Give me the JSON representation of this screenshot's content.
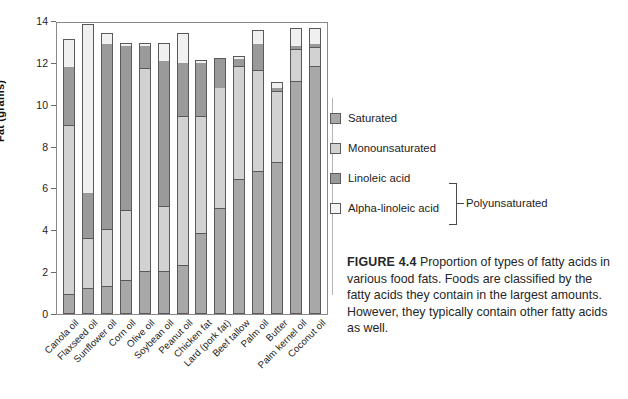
{
  "figure": {
    "number_label": "FIGURE 4.4",
    "caption_text": " Proportion of types of fatty acids in various food fats. Foods are classified by the fatty acids they contain in the largest amounts. However, they typically contain other fatty acids as well."
  },
  "legend": {
    "entries": [
      {
        "label": "Saturated",
        "key": "sat",
        "color": "#a8a8a8"
      },
      {
        "label": "Monounsaturated",
        "key": "mono",
        "color": "#d2d2d2"
      },
      {
        "label": "Linoleic acid",
        "key": "lin",
        "color": "#9a9a9a"
      },
      {
        "label": "Alpha-linoleic acid",
        "key": "ala",
        "color": "#f4f4f4"
      }
    ],
    "group_bracket_label": "Polyunsaturated"
  },
  "chart_data": {
    "type": "bar",
    "subtype": "stacked-vertical",
    "title": "",
    "xlabel": "",
    "ylabel": "Fat (grams)",
    "ylim": [
      0,
      14
    ],
    "ytick_values": [
      0,
      2,
      4,
      6,
      8,
      10,
      12,
      14
    ],
    "ytick_labels": [
      "0",
      "2",
      "4",
      "6",
      "8",
      "10",
      "12",
      "14"
    ],
    "grid": false,
    "legend_position": "right",
    "categories": [
      "Canola oil",
      "Flaxseed oil",
      "Sunflower oil",
      "Corn oil",
      "Olive oil",
      "Soybean oil",
      "Peanut oil",
      "Chicken fat",
      "Lard (pork fat)",
      "Beef tallow",
      "Palm oil",
      "Butter",
      "Palm kernel oil",
      "Coconut oil"
    ],
    "series": [
      {
        "name": "Saturated",
        "key": "sat",
        "color": "#a8a8a8",
        "values": [
          0.9,
          1.2,
          1.3,
          1.6,
          2.0,
          2.0,
          2.3,
          3.8,
          5.0,
          6.4,
          6.8,
          7.2,
          11.1,
          11.8
        ]
      },
      {
        "name": "Monounsaturated",
        "key": "mono",
        "color": "#d2d2d2",
        "values": [
          8.1,
          2.4,
          2.7,
          3.3,
          9.7,
          3.1,
          7.1,
          5.6,
          5.8,
          5.4,
          4.8,
          3.4,
          1.5,
          0.9
        ]
      },
      {
        "name": "Linoleic acid",
        "key": "lin",
        "color": "#9a9a9a",
        "values": [
          2.8,
          2.2,
          8.9,
          7.9,
          1.1,
          7.0,
          2.6,
          2.6,
          1.4,
          0.4,
          1.3,
          0.2,
          0.2,
          0.2
        ]
      },
      {
        "name": "Alpha-linoleic acid",
        "key": "ala",
        "color": "#f0f0f0",
        "values": [
          1.3,
          8.0,
          0.5,
          0.1,
          0.1,
          0.8,
          1.4,
          0.1,
          0.0,
          0.1,
          0.6,
          0.25,
          0.8,
          0.7
        ]
      }
    ],
    "totals": [
      13.1,
      13.8,
      13.4,
      12.9,
      12.9,
      12.9,
      13.4,
      12.0,
      12.2,
      12.3,
      13.5,
      11.05,
      13.6,
      13.6
    ]
  }
}
